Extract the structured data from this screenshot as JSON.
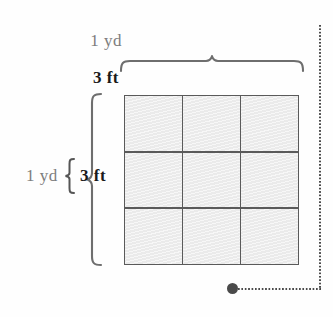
{
  "figure": {
    "background_color": "#fefefe"
  },
  "labels": {
    "top_yard": "1 yd",
    "top_feet": "3 ft",
    "left_yard": "1 yd",
    "left_feet": "3 ft"
  },
  "colors": {
    "yard_label": "#7d7d7d",
    "feet_label": "#1a1a1a",
    "grid_line": "#5a5a5a",
    "cell_fill": "#ededed",
    "callout": "#4a4a4a"
  },
  "grid": {
    "rows": 3,
    "columns": 3,
    "total_cells": 9,
    "cells": [
      "cell-1-1",
      "cell-1-2",
      "cell-1-3",
      "cell-2-1",
      "cell-2-2",
      "cell-2-3",
      "cell-3-1",
      "cell-3-2",
      "cell-3-3"
    ]
  },
  "annotations": {
    "top_brace": "brace spanning width labeled 1 yd / 3 ft",
    "left_brace": "brace spanning height labeled 3 ft",
    "small_left_brace": "brace grouping 1 yd to 3 ft",
    "callout_dot": "solid dot connector",
    "callout_dotted_line": "dotted leader line"
  }
}
